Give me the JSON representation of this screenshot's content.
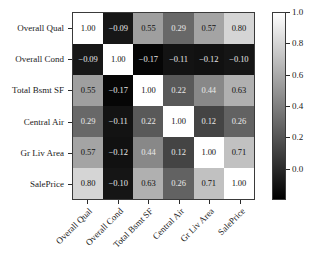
{
  "chart_data": {
    "type": "heatmap",
    "title": "",
    "xlabel": "",
    "ylabel": "",
    "categories": [
      "Overall Qual",
      "Overall Cond",
      "Total Bsmt SF",
      "Central Air",
      "Gr Liv Area",
      "SalePrice"
    ],
    "x_tick_labels": [
      "Overall Qual",
      "Overall Cond",
      "Total Bsmt SF",
      "Central Air",
      "Gr Liv Area",
      "SalePrice"
    ],
    "y_tick_labels": [
      "Overall Qual",
      "Overall Cond",
      "Total Bsmt SF",
      "Central Air",
      "Gr Liv Area",
      "SalePrice"
    ],
    "matrix": [
      [
        1.0,
        -0.09,
        0.55,
        0.29,
        0.57,
        0.8
      ],
      [
        -0.09,
        1.0,
        -0.17,
        -0.11,
        -0.12,
        -0.1
      ],
      [
        0.55,
        -0.17,
        1.0,
        0.22,
        0.44,
        0.63
      ],
      [
        0.29,
        -0.11,
        0.22,
        1.0,
        0.12,
        0.26
      ],
      [
        0.57,
        -0.12,
        0.44,
        0.12,
        1.0,
        0.71
      ],
      [
        0.8,
        -0.1,
        0.63,
        0.26,
        0.71,
        1.0
      ]
    ],
    "cell_labels": [
      [
        "1.00",
        "−0.09",
        "0.55",
        "0.29",
        "0.57",
        "0.80"
      ],
      [
        "−0.09",
        "1.00",
        "−0.17",
        "−0.11",
        "−0.12",
        "−0.10"
      ],
      [
        "0.55",
        "−0.17",
        "1.00",
        "0.22",
        "0.44",
        "0.63"
      ],
      [
        "0.29",
        "−0.11",
        "0.22",
        "1.00",
        "0.12",
        "0.26"
      ],
      [
        "0.57",
        "−0.12",
        "0.44",
        "0.12",
        "1.00",
        "0.71"
      ],
      [
        "0.80",
        "−0.10",
        "0.63",
        "0.26",
        "0.71",
        "1.00"
      ]
    ],
    "colormap": "gray",
    "vmin": -0.2,
    "vmax": 1.0,
    "grid": false,
    "legend_position": "right",
    "colorbar": {
      "ticks": [
        0.0,
        0.2,
        0.4,
        0.6,
        0.8,
        1.0
      ],
      "tick_labels": [
        "0.0",
        "0.2",
        "0.4",
        "0.6",
        "0.8",
        "1.0"
      ],
      "vmin": -0.2,
      "vmax": 1.0
    }
  },
  "colors": {
    "background": "#ffffff",
    "axis": "#3a3a3a",
    "text": "#1a1a1a",
    "low": "#000000",
    "high": "#ffffff"
  }
}
